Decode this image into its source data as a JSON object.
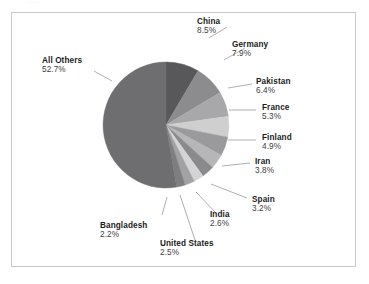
{
  "figure": {
    "background_color": "#ffffff",
    "frame_color": "#c9c9c9",
    "top_crumb_text": "......"
  },
  "chart_data": {
    "type": "pie",
    "title": "",
    "subtitle": "",
    "xlabel": "",
    "ylabel": "",
    "legend_position": "callout-labels",
    "grid": false,
    "start_angle_deg": 90,
    "direction": "clockwise",
    "center": {
      "x": 166,
      "y": 125
    },
    "radius": 63,
    "categories": [
      "China",
      "Germany",
      "Pakistan",
      "France",
      "Finland",
      "Iran",
      "Spain",
      "India",
      "United States",
      "Bangladesh",
      "All Others"
    ],
    "values": [
      8.5,
      7.9,
      6.4,
      5.3,
      4.9,
      3.8,
      3.2,
      2.6,
      2.5,
      2.2,
      52.7
    ],
    "unit": "%",
    "slices": [
      {
        "label": "China",
        "value": 8.5,
        "value_text": "8.5%",
        "color": "#58585a"
      },
      {
        "label": "Germany",
        "value": 7.9,
        "value_text": "7.9%",
        "color": "#8c8c8e"
      },
      {
        "label": "Pakistan",
        "value": 6.4,
        "value_text": "6.4%",
        "color": "#a8a8aa"
      },
      {
        "label": "France",
        "value": 5.3,
        "value_text": "5.3%",
        "color": "#cfcfd0"
      },
      {
        "label": "Finland",
        "value": 4.9,
        "value_text": "4.9%",
        "color": "#9a9a9c"
      },
      {
        "label": "Iran",
        "value": 3.8,
        "value_text": "3.8%",
        "color": "#b6b6b8"
      },
      {
        "label": "Spain",
        "value": 3.2,
        "value_text": "3.2%",
        "color": "#8a8a8c"
      },
      {
        "label": "India",
        "value": 2.6,
        "value_text": "2.6%",
        "color": "#d4d4d5"
      },
      {
        "label": "United States",
        "value": 2.5,
        "value_text": "2.5%",
        "color": "#a2a2a4"
      },
      {
        "label": "Bangladesh",
        "value": 2.2,
        "value_text": "2.2%",
        "color": "#7e7e80"
      },
      {
        "label": "All Others",
        "value": 52.7,
        "value_text": "52.7%",
        "color": "#6e6e70"
      }
    ]
  },
  "labels": {
    "china": {
      "name": "China",
      "pct": "8.5%"
    },
    "germany": {
      "name": "Germany",
      "pct": "7.9%"
    },
    "pakistan": {
      "name": "Pakistan",
      "pct": "6.4%"
    },
    "france": {
      "name": "France",
      "pct": "5.3%"
    },
    "finland": {
      "name": "Finland",
      "pct": "4.9%"
    },
    "iran": {
      "name": "Iran",
      "pct": "3.8%"
    },
    "spain": {
      "name": "Spain",
      "pct": "3.2%"
    },
    "india": {
      "name": "India",
      "pct": "2.6%"
    },
    "united_states": {
      "name": "United States",
      "pct": "2.5%"
    },
    "bangladesh": {
      "name": "Bangladesh",
      "pct": "2.2%"
    },
    "all_others": {
      "name": "All Others",
      "pct": "52.7%"
    }
  }
}
